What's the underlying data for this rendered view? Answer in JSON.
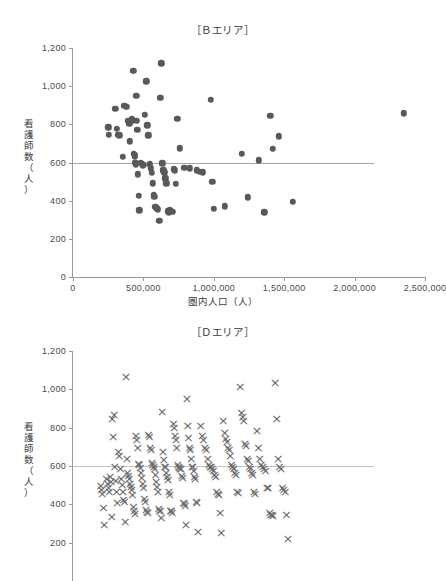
{
  "chart_data": [
    {
      "id": "chart-b",
      "type": "scatter",
      "title": "［Ｂエリア］",
      "xlabel": "圏内人口（人）",
      "ylabel": "看護師数（人）",
      "ylabel_chars": [
        "看",
        "護",
        "師",
        "数",
        "（",
        "人",
        "）"
      ],
      "xlim": [
        0,
        2500000
      ],
      "ylim": [
        0,
        1200
      ],
      "xticks": [
        0,
        500000,
        1000000,
        1500000,
        2000000,
        2500000
      ],
      "xticklabels": [
        "0",
        "500,000",
        "1,000,000",
        "1,500,000",
        "2,000,000",
        "2,500,000"
      ],
      "yticks": [
        0,
        200,
        400,
        600,
        800,
        1000,
        1200
      ],
      "yticklabels": [
        "0",
        "200",
        "400",
        "600",
        "800",
        "1,000",
        "1,200"
      ],
      "grid": false,
      "legend": "none",
      "marker": "filled-circle",
      "marker_color": "#595959",
      "reference_line": {
        "y": 600,
        "x_start": 0,
        "x_end": 2140000,
        "color": "#a7a7a7"
      },
      "points": [
        [
          250000,
          785
        ],
        [
          255000,
          745
        ],
        [
          300000,
          880
        ],
        [
          310000,
          775
        ],
        [
          320000,
          745
        ],
        [
          330000,
          742
        ],
        [
          355000,
          630
        ],
        [
          365000,
          898
        ],
        [
          378000,
          893
        ],
        [
          390000,
          820
        ],
        [
          395000,
          812
        ],
        [
          400000,
          805
        ],
        [
          405000,
          712
        ],
        [
          418000,
          830
        ],
        [
          420000,
          822
        ],
        [
          428000,
          1080
        ],
        [
          432000,
          645
        ],
        [
          438000,
          640
        ],
        [
          440000,
          632
        ],
        [
          443000,
          598
        ],
        [
          448000,
          590
        ],
        [
          450000,
          950
        ],
        [
          452000,
          820
        ],
        [
          458000,
          770
        ],
        [
          462000,
          538
        ],
        [
          466000,
          425
        ],
        [
          472000,
          350
        ],
        [
          480000,
          600
        ],
        [
          488000,
          592
        ],
        [
          494000,
          585
        ],
        [
          500000,
          588
        ],
        [
          510000,
          850
        ],
        [
          520000,
          1025
        ],
        [
          528000,
          795
        ],
        [
          536000,
          742
        ],
        [
          545000,
          590
        ],
        [
          552000,
          570
        ],
        [
          558000,
          545
        ],
        [
          565000,
          492
        ],
        [
          572000,
          432
        ],
        [
          578000,
          420
        ],
        [
          584000,
          368
        ],
        [
          590000,
          362
        ],
        [
          596000,
          360
        ],
        [
          604000,
          355
        ],
        [
          612000,
          293
        ],
        [
          620000,
          938
        ],
        [
          626000,
          1120
        ],
        [
          634000,
          595
        ],
        [
          640000,
          560
        ],
        [
          648000,
          548
        ],
        [
          656000,
          518
        ],
        [
          664000,
          490
        ],
        [
          672000,
          345
        ],
        [
          680000,
          338
        ],
        [
          688000,
          352
        ],
        [
          696000,
          348
        ],
        [
          705000,
          342
        ],
        [
          716000,
          565
        ],
        [
          722000,
          560
        ],
        [
          730000,
          488
        ],
        [
          740000,
          828
        ],
        [
          760000,
          675
        ],
        [
          790000,
          572
        ],
        [
          830000,
          570
        ],
        [
          880000,
          560
        ],
        [
          900000,
          552
        ],
        [
          920000,
          548
        ],
        [
          980000,
          928
        ],
        [
          990000,
          498
        ],
        [
          1000000,
          358
        ],
        [
          1080000,
          370
        ],
        [
          1200000,
          645
        ],
        [
          1240000,
          418
        ],
        [
          1320000,
          612
        ],
        [
          1360000,
          340
        ],
        [
          1400000,
          845
        ],
        [
          1420000,
          672
        ],
        [
          1460000,
          738
        ],
        [
          1560000,
          395
        ],
        [
          2350000,
          858
        ]
      ]
    },
    {
      "id": "chart-d",
      "type": "scatter",
      "title": "［Ｄエリア］",
      "xlabel": "",
      "ylabel": "看護師数（人）",
      "ylabel_chars": [
        "看",
        "護",
        "師",
        "数",
        "（",
        "人",
        "）"
      ],
      "xlim": [
        0,
        2500000
      ],
      "ylim": [
        0,
        1200
      ],
      "yticks": [
        200,
        400,
        600,
        800,
        1000,
        1200
      ],
      "yticklabels": [
        "200",
        "400",
        "600",
        "800",
        "1,000",
        "1,200"
      ],
      "grid": false,
      "legend": "none",
      "marker": "x",
      "marker_color": "#6b6b6b",
      "reference_line": {
        "y": 600,
        "x_start": 0,
        "x_end": 2140000,
        "color": "#c2c2c2"
      },
      "points": [
        [
          190000,
          500
        ],
        [
          195000,
          478
        ],
        [
          200000,
          460
        ],
        [
          210000,
          385
        ],
        [
          215000,
          298
        ],
        [
          230000,
          535
        ],
        [
          240000,
          510
        ],
        [
          245000,
          490
        ],
        [
          250000,
          470
        ],
        [
          258000,
          548
        ],
        [
          262000,
          520
        ],
        [
          268000,
          338
        ],
        [
          272000,
          850
        ],
        [
          278000,
          758
        ],
        [
          285000,
          870
        ],
        [
          290000,
          600
        ],
        [
          296000,
          528
        ],
        [
          302000,
          470
        ],
        [
          308000,
          410
        ],
        [
          316000,
          680
        ],
        [
          322000,
          660
        ],
        [
          330000,
          590
        ],
        [
          336000,
          540
        ],
        [
          342000,
          508
        ],
        [
          348000,
          468
        ],
        [
          352000,
          428
        ],
        [
          358000,
          420
        ],
        [
          364000,
          312
        ],
        [
          370000,
          1070
        ],
        [
          376000,
          640
        ],
        [
          380000,
          570
        ],
        [
          386000,
          552
        ],
        [
          392000,
          540
        ],
        [
          398000,
          512
        ],
        [
          404000,
          495
        ],
        [
          410000,
          478
        ],
        [
          416000,
          452
        ],
        [
          422000,
          390
        ],
        [
          428000,
          368
        ],
        [
          434000,
          355
        ],
        [
          440000,
          762
        ],
        [
          446000,
          740
        ],
        [
          452000,
          700
        ],
        [
          458000,
          618
        ],
        [
          464000,
          608
        ],
        [
          470000,
          596
        ],
        [
          476000,
          570
        ],
        [
          482000,
          545
        ],
        [
          488000,
          510
        ],
        [
          494000,
          490
        ],
        [
          500000,
          432
        ],
        [
          506000,
          420
        ],
        [
          512000,
          378
        ],
        [
          518000,
          365
        ],
        [
          524000,
          360
        ],
        [
          530000,
          768
        ],
        [
          536000,
          758
        ],
        [
          542000,
          700
        ],
        [
          548000,
          690
        ],
        [
          554000,
          620
        ],
        [
          560000,
          612
        ],
        [
          566000,
          600
        ],
        [
          572000,
          588
        ],
        [
          578000,
          560
        ],
        [
          584000,
          520
        ],
        [
          590000,
          498
        ],
        [
          596000,
          470
        ],
        [
          602000,
          380
        ],
        [
          608000,
          372
        ],
        [
          614000,
          368
        ],
        [
          620000,
          335
        ],
        [
          626000,
          888
        ],
        [
          632000,
          680
        ],
        [
          638000,
          638
        ],
        [
          644000,
          602
        ],
        [
          650000,
          598
        ],
        [
          656000,
          570
        ],
        [
          662000,
          548
        ],
        [
          668000,
          530
        ],
        [
          674000,
          468
        ],
        [
          680000,
          455
        ],
        [
          686000,
          372
        ],
        [
          692000,
          368
        ],
        [
          698000,
          360
        ],
        [
          706000,
          822
        ],
        [
          712000,
          805
        ],
        [
          718000,
          760
        ],
        [
          724000,
          740
        ],
        [
          730000,
          700
        ],
        [
          736000,
          608
        ],
        [
          742000,
          600
        ],
        [
          748000,
          596
        ],
        [
          754000,
          590
        ],
        [
          760000,
          588
        ],
        [
          766000,
          552
        ],
        [
          772000,
          542
        ],
        [
          778000,
          410
        ],
        [
          784000,
          405
        ],
        [
          790000,
          398
        ],
        [
          796000,
          300
        ],
        [
          802000,
          955
        ],
        [
          808000,
          812
        ],
        [
          814000,
          752
        ],
        [
          820000,
          700
        ],
        [
          826000,
          688
        ],
        [
          832000,
          640
        ],
        [
          838000,
          602
        ],
        [
          844000,
          598
        ],
        [
          850000,
          580
        ],
        [
          856000,
          548
        ],
        [
          862000,
          540
        ],
        [
          868000,
          418
        ],
        [
          874000,
          412
        ],
        [
          880000,
          262
        ],
        [
          900000,
          812
        ],
        [
          910000,
          762
        ],
        [
          920000,
          742
        ],
        [
          930000,
          700
        ],
        [
          940000,
          688
        ],
        [
          950000,
          640
        ],
        [
          958000,
          610
        ],
        [
          966000,
          602
        ],
        [
          974000,
          598
        ],
        [
          982000,
          588
        ],
        [
          990000,
          578
        ],
        [
          998000,
          560
        ],
        [
          1006000,
          550
        ],
        [
          1014000,
          470
        ],
        [
          1022000,
          460
        ],
        [
          1030000,
          452
        ],
        [
          1038000,
          362
        ],
        [
          1046000,
          255
        ],
        [
          1060000,
          840
        ],
        [
          1070000,
          780
        ],
        [
          1078000,
          748
        ],
        [
          1086000,
          730
        ],
        [
          1094000,
          700
        ],
        [
          1102000,
          690
        ],
        [
          1110000,
          660
        ],
        [
          1118000,
          612
        ],
        [
          1126000,
          600
        ],
        [
          1134000,
          590
        ],
        [
          1142000,
          570
        ],
        [
          1150000,
          560
        ],
        [
          1158000,
          470
        ],
        [
          1166000,
          462
        ],
        [
          1180000,
          1018
        ],
        [
          1190000,
          882
        ],
        [
          1198000,
          862
        ],
        [
          1206000,
          840
        ],
        [
          1214000,
          722
        ],
        [
          1222000,
          712
        ],
        [
          1230000,
          640
        ],
        [
          1238000,
          630
        ],
        [
          1246000,
          598
        ],
        [
          1254000,
          588
        ],
        [
          1262000,
          570
        ],
        [
          1270000,
          560
        ],
        [
          1278000,
          468
        ],
        [
          1286000,
          460
        ],
        [
          1300000,
          788
        ],
        [
          1310000,
          700
        ],
        [
          1320000,
          640
        ],
        [
          1330000,
          612
        ],
        [
          1340000,
          600
        ],
        [
          1350000,
          590
        ],
        [
          1360000,
          580
        ],
        [
          1370000,
          490
        ],
        [
          1380000,
          488
        ],
        [
          1390000,
          358
        ],
        [
          1398000,
          350
        ],
        [
          1406000,
          348
        ],
        [
          1414000,
          345
        ],
        [
          1430000,
          1038
        ],
        [
          1440000,
          852
        ],
        [
          1450000,
          640
        ],
        [
          1460000,
          600
        ],
        [
          1470000,
          588
        ],
        [
          1480000,
          490
        ],
        [
          1490000,
          482
        ],
        [
          1500000,
          472
        ],
        [
          1510000,
          348
        ],
        [
          1520000,
          222
        ]
      ]
    }
  ]
}
